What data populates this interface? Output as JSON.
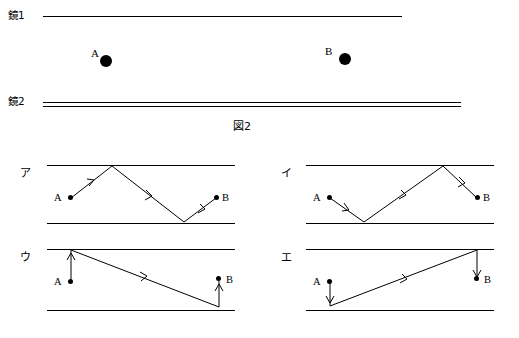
{
  "top_figure": {
    "mirror1_label": "鏡1",
    "mirror2_label": "鏡2",
    "point_a_label": "A",
    "point_b_label": "B",
    "caption": "図2"
  },
  "panels": [
    {
      "key": "a",
      "label": "ア",
      "point_a_label": "A",
      "point_b_label": "B"
    },
    {
      "key": "i",
      "label": "イ",
      "point_a_label": "A",
      "point_b_label": "B"
    },
    {
      "key": "u",
      "label": "ウ",
      "point_a_label": "A",
      "point_b_label": "B"
    },
    {
      "key": "e",
      "label": "エ",
      "point_a_label": "A",
      "point_b_label": "B"
    }
  ],
  "colors": {
    "ink": "#000000",
    "background": "#ffffff"
  }
}
